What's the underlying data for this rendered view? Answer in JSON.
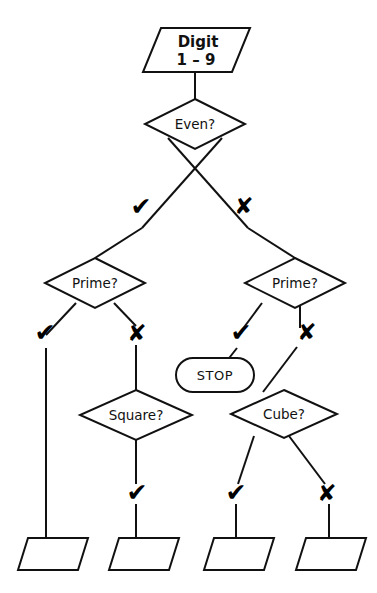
{
  "diagram": {
    "stroke_color": "#111111",
    "fill_color": "#ffffff",
    "yes_symbol": "✔",
    "no_symbol": "✘"
  },
  "nodes": {
    "input": {
      "type": "parallelogram",
      "line1": "Digit",
      "line2": "1 – 9"
    },
    "even": {
      "type": "diamond",
      "label": "Even?"
    },
    "prime_left": {
      "type": "diamond",
      "label": "Prime?"
    },
    "prime_right": {
      "type": "diamond",
      "label": "Prime?"
    },
    "stop": {
      "type": "terminal",
      "label": "STOP"
    },
    "square": {
      "type": "diamond",
      "label": "Square?"
    },
    "cube": {
      "type": "diamond",
      "label": "Cube?"
    },
    "out1": {
      "type": "parallelogram",
      "label": ""
    },
    "out2": {
      "type": "parallelogram",
      "label": ""
    },
    "out3": {
      "type": "parallelogram",
      "label": ""
    },
    "out4": {
      "type": "parallelogram",
      "label": ""
    }
  },
  "edge_labels": {
    "even_yes": "✔",
    "even_no": "✘",
    "prime_left_yes": "✔",
    "prime_left_no": "✘",
    "prime_right_yes": "✔",
    "prime_right_no": "✘",
    "square_yes": "✔",
    "cube_yes": "✔",
    "cube_no": "✘"
  }
}
